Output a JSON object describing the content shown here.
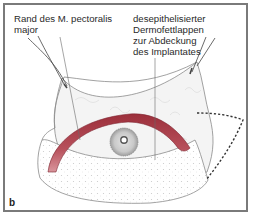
{
  "figure": {
    "panel_letter": "b",
    "labels": {
      "left": {
        "lines": [
          "Rand des M. pectoralis",
          "major"
        ]
      },
      "right": {
        "lines": [
          "desepithelisierter",
          "Dermofettlappen",
          "zur Abdeckung",
          "des Implantates"
        ]
      }
    },
    "colors": {
      "frame": "#7a7a7a",
      "muscle_band": "#b0434e",
      "muscle_band_light": "#d88890",
      "skin_outline": "#8a8a8a",
      "tissue_fill": "#f2f2f2",
      "areola": "#bdbdbd",
      "dotted_outline": "#333333"
    }
  }
}
